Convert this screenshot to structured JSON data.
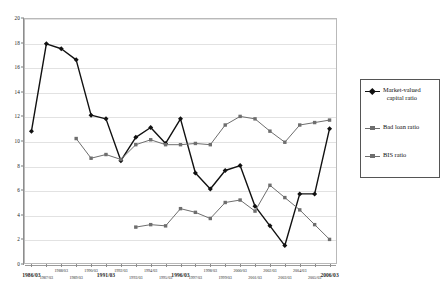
{
  "chart_data": {
    "type": "line",
    "title": "",
    "xlabel": "",
    "ylabel": "",
    "ylim": [
      0,
      20
    ],
    "ytick_step": 2,
    "yticks": [
      "0",
      "2",
      "4",
      "6",
      "8",
      "10",
      "12",
      "14",
      "16",
      "18",
      "20"
    ],
    "grid": true,
    "legend_position": "right-outside",
    "categories": [
      "1986/03",
      "1987/03",
      "1988/03",
      "1989/03",
      "1990/03",
      "1991/03",
      "1992/03",
      "1993/03",
      "1994/03",
      "1995/03",
      "1996/03",
      "1997/03",
      "1998/03",
      "1999/03",
      "2000/03",
      "2001/03",
      "2002/03",
      "2003/03",
      "2004/03",
      "2005/03",
      "2006/03"
    ],
    "xtick_labels_primary": [
      "1986/03",
      "1991/03",
      "1996/03",
      "2006/03"
    ],
    "series": [
      {
        "name": "Market-valued capital ratio",
        "marker": "diamond",
        "color": "#111111",
        "values": [
          10.8,
          17.9,
          17.5,
          16.6,
          12.1,
          11.8,
          8.4,
          10.3,
          11.1,
          9.8,
          11.8,
          7.4,
          6.1,
          7.6,
          8.0,
          4.7,
          3.1,
          1.5,
          5.7,
          5.7,
          11.0
        ]
      },
      {
        "name": "Bad loan ratio",
        "marker": "square",
        "color": "#6e6e6e",
        "values": [
          null,
          null,
          null,
          null,
          null,
          null,
          null,
          3.0,
          3.2,
          3.1,
          4.5,
          4.2,
          3.7,
          5.0,
          5.2,
          4.3,
          6.4,
          5.4,
          4.4,
          3.2,
          2.0
        ]
      },
      {
        "name": "BIS ratio",
        "marker": "square",
        "color": "#6e6e6e",
        "values": [
          null,
          null,
          null,
          10.2,
          8.6,
          8.9,
          8.5,
          9.7,
          10.1,
          9.7,
          9.7,
          9.8,
          9.7,
          11.3,
          12.0,
          11.8,
          10.8,
          9.9,
          11.3,
          11.5,
          11.7
        ]
      }
    ]
  },
  "legend": {
    "entries": [
      {
        "label_line1": "Market-valued",
        "label_line2": "capital ratio"
      },
      {
        "label_line1": "Bad loan ratio",
        "label_line2": ""
      },
      {
        "label_line1": "BIS ratio",
        "label_line2": ""
      }
    ]
  }
}
